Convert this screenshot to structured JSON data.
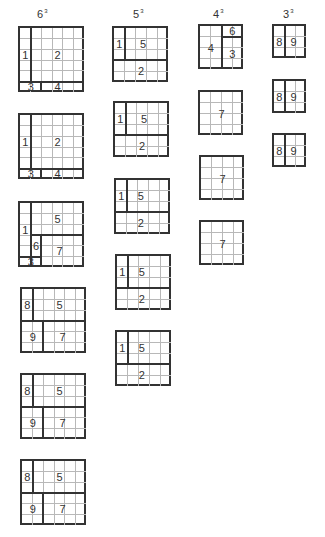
{
  "columns": [
    {
      "title": "6",
      "exp": "3",
      "x": 37,
      "size": 6,
      "cell": 10.7,
      "grids": [
        {
          "x": 18,
          "y": 26,
          "regions": [
            {
              "label": "1",
              "cells": [
                [
                  0,
                  0
                ],
                [
                  1,
                  0
                ],
                [
                  2,
                  0
                ],
                [
                  3,
                  0
                ],
                [
                  4,
                  0
                ]
              ]
            },
            {
              "label": "2",
              "r0": 0,
              "r1": 4,
              "c0": 1,
              "c1": 5
            },
            {
              "label": "3",
              "r0": 5,
              "r1": 5,
              "c0": 0,
              "c1": 1
            },
            {
              "label": "4",
              "r0": 5,
              "r1": 5,
              "c0": 2,
              "c1": 5
            }
          ],
          "labels": [
            {
              "t": "1",
              "r": 2.5,
              "c": 0.5
            },
            {
              "t": "2",
              "r": 2.5,
              "c": 3.5
            },
            {
              "t": "3",
              "r": 5.5,
              "c": 1.0
            },
            {
              "t": "4",
              "r": 5.5,
              "c": 3.5
            }
          ]
        },
        {
          "x": 18,
          "y": 113,
          "labels": [
            {
              "t": "1",
              "r": 2.5,
              "c": 0.5
            },
            {
              "t": "2",
              "r": 2.5,
              "c": 3.5
            },
            {
              "t": "3",
              "r": 5.5,
              "c": 1.0
            },
            {
              "t": "4",
              "r": 5.5,
              "c": 3.5
            }
          ]
        },
        {
          "x": 18,
          "y": 201,
          "labels": [
            {
              "t": "5",
              "r": 1.5,
              "c": 3.5
            },
            {
              "t": "1",
              "r": 2.5,
              "c": 0.5
            },
            {
              "t": "6",
              "r": 4.0,
              "c": 1.5
            },
            {
              "t": "7",
              "r": 4.5,
              "c": 3.7
            },
            {
              "t": "3",
              "r": 5.5,
              "c": 1.0
            }
          ]
        },
        {
          "x": 20,
          "y": 287,
          "labels": [
            {
              "t": "8",
              "r": 1.5,
              "c": 0.5
            },
            {
              "t": "5",
              "r": 1.5,
              "c": 3.5
            },
            {
              "t": "9",
              "r": 4.5,
              "c": 1.0
            },
            {
              "t": "7",
              "r": 4.5,
              "c": 3.8
            }
          ]
        },
        {
          "x": 20,
          "y": 373,
          "labels": [
            {
              "t": "8",
              "r": 1.5,
              "c": 0.5
            },
            {
              "t": "5",
              "r": 1.5,
              "c": 3.5
            },
            {
              "t": "9",
              "r": 4.5,
              "c": 1.0
            },
            {
              "t": "7",
              "r": 4.5,
              "c": 3.8
            }
          ]
        },
        {
          "x": 20,
          "y": 459,
          "labels": [
            {
              "t": "8",
              "r": 1.5,
              "c": 0.5
            },
            {
              "t": "5",
              "r": 1.5,
              "c": 3.5
            },
            {
              "t": "9",
              "r": 4.5,
              "c": 1.0
            },
            {
              "t": "7",
              "r": 4.5,
              "c": 3.8
            }
          ]
        }
      ]
    },
    {
      "title": "5",
      "exp": "3",
      "x": 133,
      "size": 5,
      "cell": 10.8,
      "grids": [
        {
          "x": 112,
          "y": 26,
          "labels": [
            {
              "t": "1",
              "r": 1.5,
              "c": 0.5
            },
            {
              "t": "5",
              "r": 1.5,
              "c": 2.7
            },
            {
              "t": "2",
              "r": 4.0,
              "c": 2.5
            }
          ]
        },
        {
          "x": 113,
          "y": 101,
          "labels": [
            {
              "t": "1",
              "r": 1.5,
              "c": 0.5
            },
            {
              "t": "5",
              "r": 1.5,
              "c": 2.7
            },
            {
              "t": "2",
              "r": 4.0,
              "c": 2.5
            }
          ]
        },
        {
          "x": 114,
          "y": 178,
          "labels": [
            {
              "t": "1",
              "r": 1.5,
              "c": 0.5
            },
            {
              "t": "5",
              "r": 1.5,
              "c": 2.3
            },
            {
              "t": "2",
              "r": 4.0,
              "c": 2.3
            }
          ]
        },
        {
          "x": 115,
          "y": 254,
          "labels": [
            {
              "t": "1",
              "r": 1.5,
              "c": 0.5
            },
            {
              "t": "5",
              "r": 1.5,
              "c": 2.3
            },
            {
              "t": "2",
              "r": 4.0,
              "c": 2.3
            }
          ]
        },
        {
          "x": 115,
          "y": 330,
          "labels": [
            {
              "t": "1",
              "r": 1.5,
              "c": 0.5
            },
            {
              "t": "5",
              "r": 1.5,
              "c": 2.3
            },
            {
              "t": "2",
              "r": 4.0,
              "c": 2.3
            }
          ]
        }
      ]
    },
    {
      "title": "4",
      "exp": "3",
      "x": 213,
      "size": 4,
      "cell": 10.8,
      "grids": [
        {
          "x": 198,
          "y": 24,
          "labels": [
            {
              "t": "6",
              "r": 0.5,
              "c": 3.0
            },
            {
              "t": "4",
              "r": 2.0,
              "c": 1.0
            },
            {
              "t": "3",
              "r": 2.6,
              "c": 3.0
            }
          ]
        },
        {
          "x": 198,
          "y": 90,
          "labels": [
            {
              "t": "7",
              "r": 2.0,
              "c": 2.0
            }
          ]
        },
        {
          "x": 199,
          "y": 155,
          "labels": [
            {
              "t": "7",
              "r": 2.0,
              "c": 2.0
            }
          ]
        },
        {
          "x": 199,
          "y": 220,
          "labels": [
            {
              "t": "7",
              "r": 2.0,
              "c": 2.0
            }
          ]
        }
      ]
    },
    {
      "title": "3",
      "exp": "3",
      "x": 283,
      "size": 3,
      "cell": 10.8,
      "grids": [
        {
          "x": 272,
          "y": 24,
          "labels": [
            {
              "t": "8",
              "r": 1.5,
              "c": 0.5
            },
            {
              "t": "9",
              "r": 1.5,
              "c": 1.8
            }
          ]
        },
        {
          "x": 272,
          "y": 79,
          "labels": [
            {
              "t": "8",
              "r": 1.5,
              "c": 0.5
            },
            {
              "t": "9",
              "r": 1.5,
              "c": 1.8
            }
          ]
        },
        {
          "x": 272,
          "y": 133,
          "labels": [
            {
              "t": "8",
              "r": 1.5,
              "c": 0.5
            },
            {
              "t": "9",
              "r": 1.5,
              "c": 1.8
            }
          ]
        }
      ]
    }
  ],
  "partitions": {
    "6a": {
      "v": [
        [
          1,
          0,
          5
        ]
      ],
      "h": [
        [
          5,
          0,
          6
        ]
      ],
      "v2": [
        [
          2,
          5,
          6
        ]
      ]
    },
    "6b": {
      "v": [
        [
          1,
          0,
          6
        ]
      ],
      "h": [
        [
          3,
          1,
          6
        ],
        [
          5,
          0,
          2
        ]
      ],
      "v2": [
        [
          2,
          3,
          6
        ]
      ]
    },
    "6c": {
      "v": [
        [
          1,
          0,
          3
        ],
        [
          2,
          3,
          6
        ]
      ],
      "h": [
        [
          3,
          0,
          6
        ]
      ]
    },
    "5": {
      "v": [
        [
          1,
          0,
          3
        ]
      ],
      "h": [
        [
          3,
          0,
          5
        ]
      ]
    },
    "4a": {
      "v": [
        [
          2,
          0,
          4
        ]
      ],
      "h": [
        [
          1,
          2,
          4
        ]
      ]
    },
    "4b": {
      "v": [],
      "h": []
    },
    "3": {
      "v": [
        [
          1,
          0,
          3
        ]
      ],
      "h": []
    }
  },
  "grid_styles": {
    "6": [
      "6a",
      "6a",
      "6b",
      "6c",
      "6c",
      "6c"
    ],
    "5": [
      "5",
      "5",
      "5",
      "5",
      "5"
    ],
    "4": [
      "4a",
      "4b",
      "4b",
      "4b"
    ],
    "3": [
      "3",
      "3",
      "3"
    ]
  }
}
